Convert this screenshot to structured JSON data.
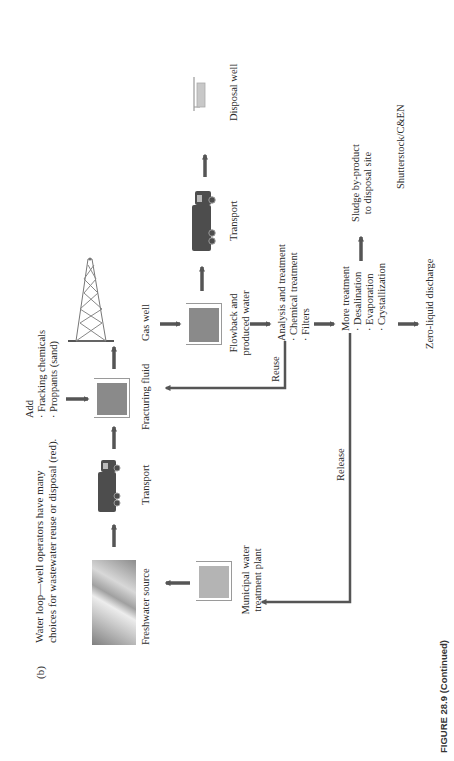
{
  "figure": {
    "panel_label": "(b)",
    "title_lines": [
      "Water loop—well operators have many",
      "choices for wastewater reuse or disposal (red)."
    ],
    "caption": "FIGURE 28.9 (Continued)",
    "credit": "Shutterstock/C&EN"
  },
  "nodes": {
    "freshwater": {
      "label": "Freshwater source",
      "icon": "landscape-photo"
    },
    "transport_1": {
      "label": "Transport",
      "icon": "truck-icon"
    },
    "fracturing_fluid": {
      "label": "Fracturing fluid",
      "icon": "tank-icon"
    },
    "add": {
      "heading": "Add",
      "items": [
        "· Fracking chemicals",
        "· Proppants (sand)"
      ]
    },
    "gas_well": {
      "label": "Gas well",
      "icon": "derrick-icon"
    },
    "flowback": {
      "label_lines": [
        "Flowback and",
        "produced water"
      ],
      "icon": "tank-icon"
    },
    "transport_2": {
      "label": "Transport",
      "icon": "truck-icon"
    },
    "disposal_well": {
      "label": "Disposal well",
      "icon": "well-icon"
    },
    "analysis": {
      "heading": "Analysis and treatment",
      "items": [
        "· Chemical treatment",
        "· Filters"
      ]
    },
    "more_treatment": {
      "heading": "More treatment",
      "items": [
        "· Desalination",
        "· Evaporation",
        "· Crystallization"
      ]
    },
    "sludge": {
      "label_lines": [
        "Sludge by-product",
        "to disposal site"
      ]
    },
    "zero_liquid": {
      "label": "Zero-liquid discharge"
    },
    "municipal": {
      "label_lines": [
        "Municipal water",
        "treatment plant"
      ],
      "icon": "tank-icon"
    }
  },
  "edges": {
    "reuse": {
      "label": "Reuse"
    },
    "release": {
      "label": "Release"
    }
  },
  "colors": {
    "arrow": "#555555",
    "tank_fill": "#8a8a8a",
    "municipal_fill": "#b4b4b4",
    "disposal_fill": "#c8c8c8",
    "text": "#2b2b2b"
  }
}
